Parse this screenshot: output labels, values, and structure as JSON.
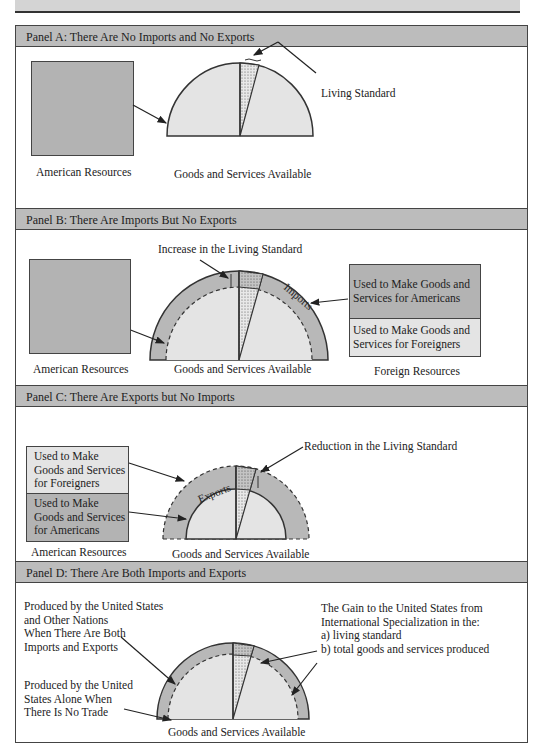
{
  "panels": {
    "a": {
      "title": "Panel A:   There Are No Imports and No Exports",
      "resources_label": "American Resources",
      "goods_label": "Goods and Services Available",
      "living_standard_label": "Living Standard"
    },
    "b": {
      "title": "Panel B:   There Are Imports But No Exports",
      "increase_label": "Increase in the Living Standard",
      "imports_label": "Imports",
      "resources_label": "American Resources",
      "goods_label": "Goods and Services Available",
      "foreign_resources_label": "Foreign Resources",
      "foreign_box_top_line1": "Used to Make Goods and",
      "foreign_box_top_line2": "Services for Americans",
      "foreign_box_bottom_line1": "Used to Make Goods and",
      "foreign_box_bottom_line2": "Services for Foreigners"
    },
    "c": {
      "title": "Panel C:   There Are Exports but No Imports",
      "reduction_label": "Reduction in the Living Standard",
      "exports_label": "Exports",
      "box_top_line1": "Used to Make",
      "box_top_line2": "Goods and Services",
      "box_top_line3": "for Foreigners",
      "box_bottom_line1": "Used to Make",
      "box_bottom_line2": "Goods and Services",
      "box_bottom_line3": "for Americans",
      "resources_label": "American Resources",
      "goods_label": "Goods and Services Available"
    },
    "d": {
      "title": "Panel D: There Are Both Imports and Exports",
      "both_line1": "Produced by the United States",
      "both_line2": "and Other Nations",
      "both_line3": "When There Are Both",
      "both_line4": "Imports and Exports",
      "alone_line1": "Produced by the United",
      "alone_line2": "States Alone When",
      "alone_line3": "There Is No Trade",
      "gain_line1": "The Gain to the United States from",
      "gain_line2": "International Specialization in the:",
      "gain_a": "a) living standard",
      "gain_b": "b) total goods and services produced",
      "goods_label": "Goods and Services Available"
    }
  },
  "colors": {
    "header_gray": "#bcbcbc",
    "resource_dark": "#b3b3b3",
    "goods_light": "#e4e4e4",
    "ring_gray": "#b8b8b8",
    "outline": "#333333"
  }
}
